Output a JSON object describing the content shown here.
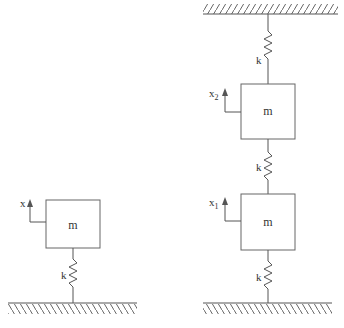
{
  "figure": {
    "type": "mass-spring system diagram",
    "systems": [
      {
        "id": "single-dof",
        "mass_label": "m",
        "spring_label": "k",
        "displacement_label": "x",
        "support": "ground"
      },
      {
        "id": "two-dof",
        "ceiling_spring_label": "k",
        "upper_mass_label": "m",
        "upper_displacement_label": "x",
        "upper_displacement_sub": "2",
        "middle_spring_label": "k",
        "lower_mass_label": "m",
        "lower_displacement_label": "x",
        "lower_displacement_sub": "1",
        "ground_spring_label": "k",
        "support": "ceiling and ground"
      }
    ]
  },
  "colors": {
    "line": "#555555",
    "text": "#333333",
    "background": "#ffffff"
  }
}
